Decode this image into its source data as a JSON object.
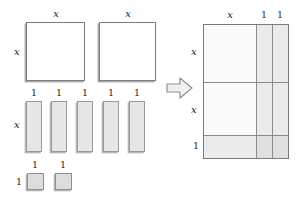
{
  "figure": {
    "transition_icon": "right-arrow-icon",
    "colors": {
      "x2_fill": "#fdfdfd",
      "x_fill": "#e6e6e6",
      "unit_fill": "#dcdcdc",
      "stroke": "#8d8d8d",
      "shadow": "#b4b4b4",
      "label_text": "#1a1a1a",
      "background": "#ffffff"
    },
    "labels": {
      "x": "x",
      "one": "1"
    }
  },
  "left_panel": {
    "name": "loose-tiles-group",
    "x_squared_tiles": {
      "count": 2,
      "items": [
        {
          "id": "x2-tile-1",
          "top_label": "x",
          "left_label": "x"
        },
        {
          "id": "x2-tile-2",
          "top_label": "x",
          "left_label": ""
        }
      ]
    },
    "x_tiles": {
      "count": 5,
      "left_label": "x",
      "items": [
        {
          "id": "x-tile-1",
          "top_label": "1"
        },
        {
          "id": "x-tile-2",
          "top_label": "1"
        },
        {
          "id": "x-tile-3",
          "top_label": "1"
        },
        {
          "id": "x-tile-4",
          "top_label": "1"
        },
        {
          "id": "x-tile-5",
          "top_label": "1"
        }
      ]
    },
    "unit_tiles": {
      "count": 2,
      "left_label": "1",
      "items": [
        {
          "id": "unit-tile-1",
          "top_label": "1"
        },
        {
          "id": "unit-tile-2",
          "top_label": "1"
        }
      ]
    }
  },
  "right_panel": {
    "name": "assembled-rectangle",
    "top_labels": [
      "x",
      "1",
      "1"
    ],
    "left_labels": [
      "x",
      "x",
      "1"
    ],
    "columns": [
      {
        "label": "x",
        "kind": "x"
      },
      {
        "label": "1",
        "kind": "unit"
      },
      {
        "label": "1",
        "kind": "unit"
      }
    ],
    "rows": [
      {
        "label": "x",
        "kind": "x"
      },
      {
        "label": "x",
        "kind": "x"
      },
      {
        "label": "1",
        "kind": "unit"
      }
    ]
  }
}
